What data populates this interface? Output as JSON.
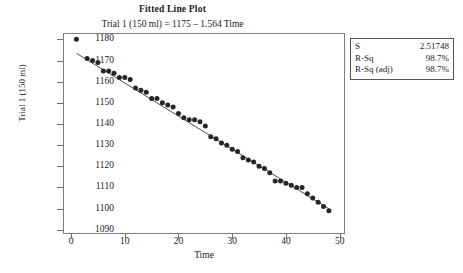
{
  "chart_data": {
    "type": "scatter",
    "title": "Fitted Line Plot",
    "subtitle": "Trial 1 (150 ml) = 1175 – 1.564 Time",
    "xlabel": "Time",
    "ylabel": "Trial 1 (150 ml)",
    "xlim": [
      -1.5,
      51
    ],
    "ylim": [
      1088,
      1183
    ],
    "xticks": [
      0,
      10,
      20,
      30,
      40,
      50
    ],
    "yticks": [
      1090,
      1100,
      1110,
      1120,
      1130,
      1140,
      1150,
      1160,
      1170,
      1180
    ],
    "grid": false,
    "legend": "none",
    "fit_line": {
      "intercept": 1175,
      "slope": -1.564,
      "x_start": 1,
      "x_end": 48,
      "color": "#3a3a3a"
    },
    "point_color": "#262626",
    "points": [
      {
        "x": 1,
        "y": 1180
      },
      {
        "x": 3,
        "y": 1171
      },
      {
        "x": 4,
        "y": 1170
      },
      {
        "x": 5,
        "y": 1169
      },
      {
        "x": 6,
        "y": 1165
      },
      {
        "x": 7,
        "y": 1165
      },
      {
        "x": 8,
        "y": 1164
      },
      {
        "x": 9,
        "y": 1162
      },
      {
        "x": 10,
        "y": 1162
      },
      {
        "x": 11,
        "y": 1161
      },
      {
        "x": 12,
        "y": 1157
      },
      {
        "x": 13,
        "y": 1156
      },
      {
        "x": 14,
        "y": 1155
      },
      {
        "x": 15,
        "y": 1152
      },
      {
        "x": 16,
        "y": 1152
      },
      {
        "x": 17,
        "y": 1150
      },
      {
        "x": 18,
        "y": 1149
      },
      {
        "x": 19,
        "y": 1148
      },
      {
        "x": 20,
        "y": 1145
      },
      {
        "x": 21,
        "y": 1143
      },
      {
        "x": 22,
        "y": 1142
      },
      {
        "x": 23,
        "y": 1142
      },
      {
        "x": 24,
        "y": 1141
      },
      {
        "x": 25,
        "y": 1139
      },
      {
        "x": 26,
        "y": 1134
      },
      {
        "x": 27,
        "y": 1133
      },
      {
        "x": 28,
        "y": 1131
      },
      {
        "x": 29,
        "y": 1130
      },
      {
        "x": 30,
        "y": 1128
      },
      {
        "x": 31,
        "y": 1127
      },
      {
        "x": 32,
        "y": 1124
      },
      {
        "x": 33,
        "y": 1123
      },
      {
        "x": 34,
        "y": 1122
      },
      {
        "x": 35,
        "y": 1120
      },
      {
        "x": 36,
        "y": 1119
      },
      {
        "x": 37,
        "y": 1117
      },
      {
        "x": 38,
        "y": 1113
      },
      {
        "x": 39,
        "y": 1113
      },
      {
        "x": 40,
        "y": 1112
      },
      {
        "x": 41,
        "y": 1111
      },
      {
        "x": 42,
        "y": 1110
      },
      {
        "x": 43,
        "y": 1110
      },
      {
        "x": 44,
        "y": 1107
      },
      {
        "x": 45,
        "y": 1105
      },
      {
        "x": 46,
        "y": 1103
      },
      {
        "x": 47,
        "y": 1101
      },
      {
        "x": 48,
        "y": 1099
      }
    ]
  },
  "stats": {
    "rows": [
      {
        "key": "S",
        "value": "2.51748"
      },
      {
        "key": "R-Sq",
        "value": "98.7%"
      },
      {
        "key": "R-Sq (adj)",
        "value": "98.7%"
      }
    ]
  }
}
